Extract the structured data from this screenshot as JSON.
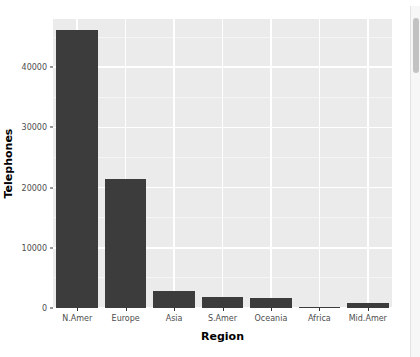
{
  "chart_data": {
    "type": "bar",
    "title": "",
    "xlabel": "Region",
    "ylabel": "Telephones",
    "categories": [
      "N.Amer",
      "Europe",
      "Asia",
      "S.Amer",
      "Oceania",
      "Africa",
      "Mid.Amer"
    ],
    "values": [
      46200,
      21500,
      2900,
      1800,
      1700,
      100,
      800
    ],
    "ylim": [
      0,
      48000
    ],
    "y_ticks": [
      0,
      10000,
      20000,
      30000,
      40000
    ],
    "y_tick_labels": [
      "0",
      "10000",
      "20000",
      "30000",
      "40000"
    ],
    "grid": true,
    "legend": "none",
    "bar_color": "#3c3c3c",
    "panel_color": "#ebebeb",
    "gridline_color": "#ffffff"
  },
  "axes": {
    "y_title": "Telephones",
    "x_title": "Region"
  },
  "scrollbar": {
    "name": "vertical-scrollbar"
  }
}
